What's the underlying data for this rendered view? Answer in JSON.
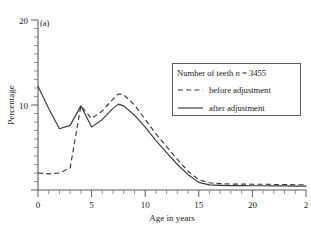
{
  "panel": {
    "label": "(a)"
  },
  "axes": {
    "y": {
      "title": "Percentage",
      "major_ticks": [
        0,
        10,
        20
      ],
      "major_tick_labels": [
        "0",
        "10",
        "20"
      ],
      "visible_tick_labels": [
        "10",
        "20"
      ],
      "minor_tick_step": 1,
      "range": [
        0,
        20
      ]
    },
    "x": {
      "title": "Age in years",
      "major_ticks": [
        0,
        5,
        10,
        15,
        20,
        25
      ],
      "major_tick_labels": [
        "0",
        "5",
        "10",
        "15",
        "20",
        "2"
      ],
      "minor_tick_step": 1,
      "range": [
        0,
        25
      ]
    }
  },
  "legend": {
    "title_prefix": "Number of teeth ",
    "title_symbol": "n",
    "title_suffix": " = 3455",
    "entries": [
      {
        "style": "dashed",
        "label": "before adjustment"
      },
      {
        "style": "solid",
        "label": "after adjustment"
      }
    ]
  },
  "colors": {
    "line": "#3a3a3a",
    "axis": "#5a5a5a",
    "background": "#ffffff",
    "text": "#1a1a1a"
  },
  "chart_data": {
    "type": "line",
    "title": "",
    "subtitle": "(a)",
    "xlabel": "Age in years",
    "ylabel": "Percentage",
    "xlim": [
      0,
      25
    ],
    "ylim": [
      0,
      20
    ],
    "grid": false,
    "legend_position": "upper-right",
    "annotations": [
      "(a)",
      "Number of teeth n = 3455"
    ],
    "x": [
      0,
      1,
      2,
      3,
      4,
      5,
      6,
      7,
      7.5,
      8,
      9,
      10,
      11,
      12,
      13,
      14,
      15,
      16,
      17,
      18,
      19,
      20,
      21,
      22,
      23,
      24,
      25
    ],
    "series": [
      {
        "name": "before adjustment",
        "style": "dashed",
        "values": [
          2.0,
          1.9,
          2.0,
          2.6,
          9.9,
          8.4,
          9.3,
          10.7,
          11.3,
          11.2,
          10.0,
          8.3,
          6.6,
          5.1,
          3.6,
          2.2,
          1.2,
          0.85,
          0.75,
          0.7,
          0.7,
          0.68,
          0.68,
          0.65,
          0.65,
          0.62,
          0.62
        ]
      },
      {
        "name": "after adjustment",
        "style": "solid",
        "values": [
          12.2,
          9.6,
          7.2,
          7.6,
          9.9,
          7.4,
          8.3,
          9.6,
          10.1,
          9.9,
          8.8,
          7.4,
          5.8,
          4.4,
          3.0,
          1.8,
          0.9,
          0.6,
          0.55,
          0.52,
          0.52,
          0.5,
          0.5,
          0.48,
          0.48,
          0.45,
          0.45
        ]
      }
    ]
  }
}
